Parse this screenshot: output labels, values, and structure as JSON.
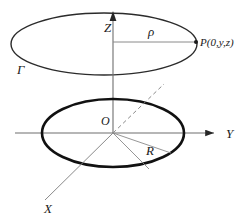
{
  "figure": {
    "background_color": "#ffffff",
    "stroke_dark": "#262626",
    "stroke_axis": "#6e6e6e",
    "stroke_thin": "#8a8a8a"
  },
  "axes": [
    {
      "id": "z",
      "label": "Z",
      "label_x": 104,
      "label_y": 32,
      "font_size": 13,
      "arrow": "up",
      "from_x": 113,
      "from_y": 133,
      "to_x": 113,
      "to_y": 13
    },
    {
      "id": "y",
      "label": "Y",
      "label_x": 226,
      "label_y": 138,
      "font_size": 13,
      "arrow": "right",
      "from_x": 15,
      "from_y": 133,
      "to_x": 219,
      "to_y": 133
    },
    {
      "id": "x",
      "label": "X",
      "label_x": 44,
      "label_y": 213,
      "font_size": 13,
      "arrow": "none",
      "from_x": 113,
      "from_y": 133,
      "to_x": 45,
      "to_y": 200
    }
  ],
  "curves": [
    {
      "id": "loop-gamma",
      "name": "upper-circular-loop",
      "cx": 104,
      "cy": 44,
      "rx": 93,
      "ry": 31,
      "stroke_width": 1.4,
      "color": "#2b2b2b"
    },
    {
      "id": "loop-base",
      "name": "lower-bold-circle",
      "cx": 113,
      "cy": 133,
      "rx": 71,
      "ry": 34,
      "stroke_width": 2.6,
      "color": "#111111"
    }
  ],
  "labels": {
    "gamma": {
      "text": "Γ",
      "x": 17,
      "y": 74,
      "font_size": 13
    },
    "rho": {
      "text": "ρ",
      "x": 148,
      "y": 36,
      "font_size": 13
    },
    "origin": {
      "text": "O",
      "x": 101,
      "y": 125,
      "font_size": 12
    },
    "radius": {
      "text": "R",
      "x": 146,
      "y": 155,
      "font_size": 13
    },
    "point_p": {
      "text": "P(0,y,z)",
      "x": 200,
      "y": 46,
      "font_size": 11
    }
  },
  "segments": [
    {
      "id": "rho-segment",
      "name": "rho-radius-line",
      "from_x": 113,
      "from_y": 42,
      "to_x": 196,
      "to_y": 42,
      "dashed": false,
      "stroke_width": 1.0
    },
    {
      "id": "x-axis-dashed",
      "name": "negative-x-dashed-line",
      "from_x": 113,
      "from_y": 133,
      "to_x": 163,
      "to_y": 85,
      "dashed": true,
      "stroke_width": 1.0
    },
    {
      "id": "radius-upper",
      "name": "radius-line-upper",
      "from_x": 113,
      "from_y": 133,
      "to_x": 170,
      "to_y": 152,
      "dashed": false,
      "stroke_width": 0.9
    },
    {
      "id": "radius-lower",
      "name": "radius-line-lower",
      "from_x": 113,
      "from_y": 133,
      "to_x": 148,
      "to_y": 168,
      "dashed": false,
      "stroke_width": 0.9
    }
  ],
  "points": [
    {
      "id": "P",
      "name": "point-p-marker",
      "x": 196,
      "y": 42,
      "r": 2.0
    }
  ]
}
